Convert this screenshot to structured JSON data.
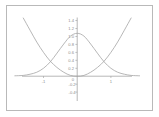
{
  "figure": {
    "border_color": "#b9b9b9",
    "background_color": "#ffffff",
    "axis_color": "#9a9a9a",
    "curve_color": "#a5a5a5",
    "label_color": "#8d8d8d"
  },
  "chart_data": {
    "type": "line",
    "title": "",
    "subtitle": "",
    "xlabel": "",
    "ylabel": "",
    "xlim": [
      -1.85,
      1.85
    ],
    "ylim": [
      -0.45,
      1.5
    ],
    "grid": false,
    "legend": "none",
    "x_ticks": [
      {
        "value": -1,
        "label": "-1"
      },
      {
        "value": 1,
        "label": "1"
      }
    ],
    "y_ticks": [
      {
        "value": 1.4,
        "label": "1.4"
      },
      {
        "value": 1.2,
        "label": "1.2"
      },
      {
        "value": 1.0,
        "label": "1.0"
      },
      {
        "value": 0.8,
        "label": "0.8"
      },
      {
        "value": 0.6,
        "label": "0.6"
      },
      {
        "value": 0.4,
        "label": "0.4"
      },
      {
        "value": 0.2,
        "label": "0.2"
      },
      {
        "value": 0.0,
        "label": "0"
      },
      {
        "value": -0.2,
        "label": "-0.2"
      },
      {
        "value": -0.4,
        "label": "-0.4"
      }
    ],
    "series": [
      {
        "name": "gaussian",
        "shape": "bell",
        "peak_x": 0,
        "peak_y": 1.08,
        "x": [
          -1.85,
          -1.6,
          -1.4,
          -1.2,
          -1.0,
          -0.8,
          -0.6,
          -0.4,
          -0.2,
          0,
          0.2,
          0.4,
          0.6,
          0.8,
          1.0,
          1.2,
          1.4,
          1.6,
          1.85
        ],
        "values": [
          0.01,
          0.02,
          0.05,
          0.1,
          0.2,
          0.36,
          0.58,
          0.81,
          1.01,
          1.08,
          1.01,
          0.81,
          0.58,
          0.36,
          0.2,
          0.1,
          0.05,
          0.02,
          0.01
        ]
      },
      {
        "name": "parabola",
        "shape": "u-curve",
        "vertex_x": 0,
        "vertex_y": 0.0,
        "x": [
          -1.6,
          -1.4,
          -1.2,
          -1.0,
          -0.8,
          -0.6,
          -0.4,
          -0.2,
          0,
          0.2,
          0.4,
          0.6,
          0.8,
          1.0,
          1.2,
          1.4,
          1.6
        ],
        "values": [
          1.52,
          1.16,
          0.86,
          0.6,
          0.38,
          0.22,
          0.1,
          0.02,
          0.0,
          0.02,
          0.1,
          0.22,
          0.38,
          0.6,
          0.86,
          1.16,
          1.52
        ]
      }
    ]
  }
}
